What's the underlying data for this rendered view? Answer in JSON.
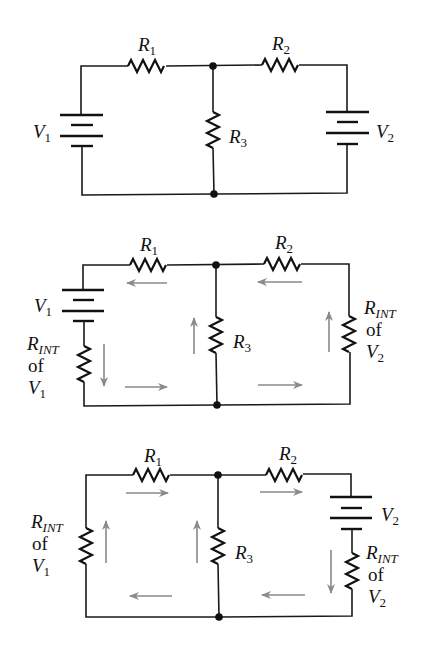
{
  "figure": {
    "wire_color": "#1a1a1a",
    "arrow_color": "#8a8a8a",
    "background": "#ffffff"
  },
  "circuit1": {
    "r1": {
      "letter": "R",
      "sub": "1"
    },
    "r2": {
      "letter": "R",
      "sub": "2"
    },
    "r3": {
      "letter": "R",
      "sub": "3"
    },
    "v1": {
      "letter": "V",
      "sub": "1"
    },
    "v2": {
      "letter": "V",
      "sub": "2"
    }
  },
  "circuit2": {
    "r1": {
      "letter": "R",
      "sub": "1"
    },
    "r2": {
      "letter": "R",
      "sub": "2"
    },
    "r3": {
      "letter": "R",
      "sub": "3"
    },
    "v1": {
      "letter": "V",
      "sub": "1"
    },
    "rint_v1": {
      "letter": "R",
      "sub": "INT",
      "of": "of",
      "src_letter": "V",
      "src_sub": "1"
    },
    "rint_v2": {
      "letter": "R",
      "sub": "INT",
      "of": "of",
      "src_letter": "V",
      "src_sub": "2"
    },
    "arrows": [
      "left (under R1)",
      "left (under R2)",
      "down (beside R_INT of V1)",
      "up (beside R3)",
      "up (beside R_INT of V2)",
      "right (bottom left loop)",
      "right (bottom right loop)"
    ]
  },
  "circuit3": {
    "r1": {
      "letter": "R",
      "sub": "1"
    },
    "r2": {
      "letter": "R",
      "sub": "2"
    },
    "r3": {
      "letter": "R",
      "sub": "3"
    },
    "v2": {
      "letter": "V",
      "sub": "2"
    },
    "rint_v1": {
      "letter": "R",
      "sub": "INT",
      "of": "of",
      "src_letter": "V",
      "src_sub": "1"
    },
    "rint_v2": {
      "letter": "R",
      "sub": "INT",
      "of": "of",
      "src_letter": "V",
      "src_sub": "2"
    },
    "arrows": [
      "right (under R1)",
      "right (under R2)",
      "up (beside R_INT of V1)",
      "up (beside R3)",
      "down (beside R_INT of V2)",
      "left (bottom left loop)",
      "left (bottom right loop)"
    ]
  }
}
